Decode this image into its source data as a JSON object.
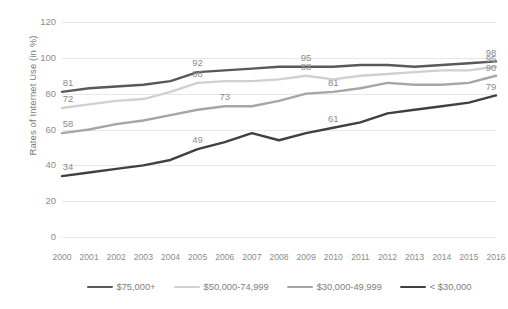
{
  "chart_data": {
    "type": "line",
    "title": "",
    "xlabel": "",
    "ylabel": "Rates of Internet Use (in %)",
    "categories": [
      "2000",
      "2001",
      "2002",
      "2003",
      "2004",
      "2005",
      "2006",
      "2007",
      "2008",
      "2009",
      "2010",
      "2011",
      "2012",
      "2013",
      "2014",
      "2015",
      "2016"
    ],
    "x": [
      2000,
      2001,
      2002,
      2003,
      2004,
      2005,
      2006,
      2007,
      2008,
      2009,
      2010,
      2011,
      2012,
      2013,
      2014,
      2015,
      2016
    ],
    "ylim": [
      0,
      120
    ],
    "yticks": [
      0,
      20,
      40,
      60,
      80,
      100,
      120
    ],
    "grid": true,
    "legend_position": "bottom",
    "series": [
      {
        "name": "$75,000+",
        "color": "#595959",
        "values": [
          81,
          83,
          84,
          85,
          87,
          92,
          93,
          94,
          95,
          95,
          95,
          96,
          96,
          95,
          96,
          97,
          98
        ],
        "labels": [
          {
            "index": 0,
            "value": 81
          },
          {
            "index": 5,
            "value": 92
          },
          {
            "index": 9,
            "value": 95
          },
          {
            "index": 16,
            "value": 98
          }
        ]
      },
      {
        "name": "$50,000-74,999",
        "color": "#d0d0d0",
        "values": [
          72,
          74,
          76,
          77,
          81,
          86,
          87,
          87,
          88,
          90,
          88,
          90,
          91,
          92,
          93,
          93,
          95
        ],
        "labels": [
          {
            "index": 0,
            "value": 72
          },
          {
            "index": 5,
            "value": 86
          },
          {
            "index": 9,
            "value": 88
          },
          {
            "index": 16,
            "value": 95
          }
        ]
      },
      {
        "name": "$30,000-49,999",
        "color": "#a6a6a6",
        "values": [
          58,
          60,
          63,
          65,
          68,
          71,
          73,
          73,
          76,
          80,
          81,
          83,
          86,
          85,
          85,
          86,
          90
        ],
        "labels": [
          {
            "index": 0,
            "value": 58
          },
          {
            "index": 6,
            "value": 73
          },
          {
            "index": 10,
            "value": 81
          },
          {
            "index": 16,
            "value": 90
          }
        ]
      },
      {
        "name": "< $30,000",
        "color": "#404040",
        "values": [
          34,
          36,
          38,
          40,
          43,
          49,
          53,
          58,
          54,
          58,
          61,
          64,
          69,
          71,
          73,
          75,
          79
        ],
        "labels": [
          {
            "index": 0,
            "value": 34
          },
          {
            "index": 5,
            "value": 49
          },
          {
            "index": 10,
            "value": 61
          },
          {
            "index": 16,
            "value": 79
          }
        ]
      }
    ]
  },
  "legend": {
    "items": [
      {
        "label": "$75,000+",
        "color": "#595959"
      },
      {
        "label": "$50,000-74,999",
        "color": "#d0d0d0"
      },
      {
        "label": "$30,000-49,999",
        "color": "#a6a6a6"
      },
      {
        "label": "< $30,000",
        "color": "#404040"
      }
    ]
  },
  "axis": {
    "y_title": "Rates of Internet Use (in %)"
  }
}
